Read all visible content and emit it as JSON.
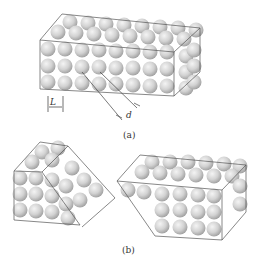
{
  "figure": {
    "panel_a": {
      "caption": "(a)",
      "dimension_labels": {
        "L": "L",
        "d": "d"
      },
      "description": "Rectangular block of close-packed spheres (3 rows × 8 columns front face) with spacing L and slip plane distance d"
    },
    "panel_b": {
      "caption": "(b)",
      "description": "Block sheared along slip plane: left shows diagonal cut, right shows displaced block"
    },
    "colors": {
      "sphere_fill": "#d4d4d4",
      "sphere_highlight": "#f2f2f2",
      "sphere_shadow": "#9a9a9a",
      "outline": "#555555"
    }
  }
}
